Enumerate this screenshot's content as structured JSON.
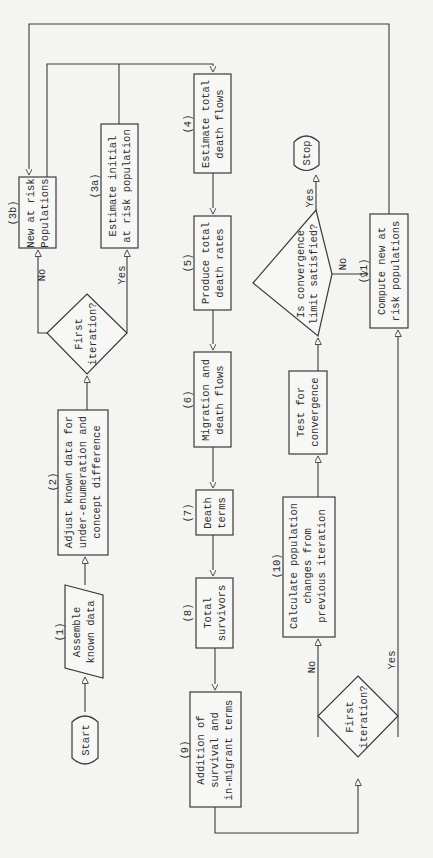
{
  "diagram": {
    "orientation": "rotated 90deg counter-clockwise",
    "nodes": {
      "start": {
        "label": "Start"
      },
      "n1": {
        "num": "(1)",
        "lines": [
          "Assemble",
          "known data"
        ]
      },
      "n2": {
        "num": "(2)",
        "lines": [
          "Adjust known data for",
          "under-enumeration and",
          "concept difference"
        ]
      },
      "d1": {
        "lines": [
          "First",
          "iteration?"
        ]
      },
      "n3a": {
        "num": "(3a)",
        "lines": [
          "Estimate initial",
          "at risk population"
        ]
      },
      "n3b": {
        "num": "(3b)",
        "lines": [
          "New at risk",
          "Populations"
        ]
      },
      "n4": {
        "num": "(4)",
        "lines": [
          "Estimate total",
          "death flows"
        ]
      },
      "n5": {
        "num": "(5)",
        "lines": [
          "Produce total",
          "death rates"
        ]
      },
      "n6": {
        "num": "(6)",
        "lines": [
          "Migration and",
          "death flows"
        ]
      },
      "n7": {
        "num": "(7)",
        "lines": [
          "Death",
          "terms"
        ]
      },
      "n8": {
        "num": "(8)",
        "lines": [
          "Total",
          "survivors"
        ]
      },
      "n9": {
        "num": "(9)",
        "lines": [
          "Addition of",
          "survival and",
          "in-migrant terms"
        ]
      },
      "d2": {
        "lines": [
          "First",
          "iteration?"
        ]
      },
      "n10": {
        "num": "(10)",
        "lines": [
          "Calculate population",
          "changes from",
          "previous iteration"
        ]
      },
      "test": {
        "lines": [
          "Test for",
          "convergence"
        ]
      },
      "d3": {
        "lines": [
          "Is convergence",
          "limit satisfied?"
        ]
      },
      "stop": {
        "label": "Stop"
      },
      "n11": {
        "num": "(11)",
        "lines": [
          "Compute new at",
          "risk populations"
        ]
      }
    },
    "edge_labels": {
      "d1_no": "No",
      "d1_yes": "Yes",
      "d2_no": "No",
      "d2_yes": "Yes",
      "d3_yes": "Yes",
      "d3_no": "No"
    }
  }
}
